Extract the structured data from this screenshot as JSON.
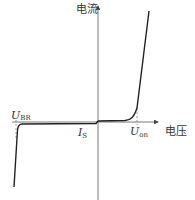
{
  "diagram": {
    "y_axis_label": "电流",
    "x_axis_label": "电压",
    "labels": {
      "breakdown": {
        "main": "U",
        "sub": "BR"
      },
      "saturation": {
        "main": "I",
        "sub": "S"
      },
      "turn_on": {
        "main": "U",
        "sub": "on"
      }
    },
    "colors": {
      "curve": "#222222",
      "axis": "#444444",
      "dash": "#777777"
    }
  }
}
